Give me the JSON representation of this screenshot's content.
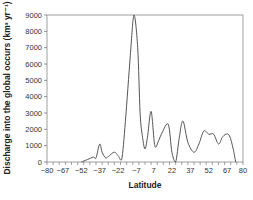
{
  "chart_data": {
    "type": "line",
    "title": "",
    "xlabel": "Latitude",
    "ylabel": "Discharge into the global occurs (km³ yr⁻¹)",
    "xlim": [
      -80,
      80
    ],
    "ylim": [
      0,
      9000
    ],
    "xticks": [
      -80,
      -67,
      -52,
      -37,
      -22,
      -7,
      7,
      22,
      37,
      52,
      67,
      80
    ],
    "yticks": [
      0,
      1000,
      2000,
      3000,
      4000,
      5000,
      6000,
      7000,
      8000,
      9000
    ],
    "grid": false,
    "legend": null,
    "series": [
      {
        "name": "Discharge",
        "x": [
          -52,
          -47,
          -42,
          -40,
          -37,
          -35,
          -32,
          -29,
          -25,
          -22,
          -19,
          -16,
          -12,
          -9,
          -6,
          -4,
          -2,
          0,
          2,
          5,
          8,
          11,
          14,
          19,
          22,
          25,
          28,
          31,
          35,
          40,
          44,
          48,
          52,
          56,
          60,
          63,
          66,
          69,
          72,
          74
        ],
        "y": [
          0,
          150,
          300,
          250,
          1100,
          600,
          250,
          400,
          600,
          400,
          150,
          2500,
          6500,
          9000,
          7000,
          3000,
          1500,
          800,
          1500,
          3100,
          1000,
          1300,
          1800,
          2300,
          600,
          0,
          1500,
          2500,
          1200,
          600,
          1100,
          1900,
          1700,
          1700,
          1100,
          1500,
          1700,
          1600,
          800,
          0
        ]
      }
    ]
  }
}
